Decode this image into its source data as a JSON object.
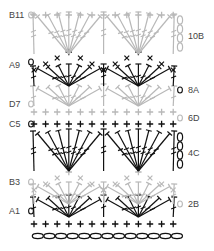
{
  "diagram": {
    "type": "crochet-chart",
    "colors": {
      "dark": "#111111",
      "light": "#b8b8b8"
    },
    "left_labels": [
      {
        "text": "B11",
        "y": 15
      },
      {
        "text": "A9",
        "y": 65
      },
      {
        "text": "D7",
        "y": 104
      },
      {
        "text": "C5",
        "y": 124
      },
      {
        "text": "B3",
        "y": 182
      },
      {
        "text": "A1",
        "y": 211
      }
    ],
    "right_labels": [
      {
        "text": "10B",
        "y": 36
      },
      {
        "text": "8A",
        "y": 90
      },
      {
        "text": "6D",
        "y": 118
      },
      {
        "text": "4C",
        "y": 153
      },
      {
        "text": "2B",
        "y": 204
      }
    ],
    "rows": [
      {
        "id": "foundation-chain",
        "y": 236,
        "symbol": "chain",
        "color": "dark",
        "count": 13
      },
      {
        "id": "row-0-sc",
        "y": 224,
        "symbol": "sc",
        "color": "dark",
        "count": 13
      },
      {
        "id": "row-1",
        "y": 211,
        "symbol": "dc-fan",
        "color": "dark"
      },
      {
        "id": "row-2",
        "y": 198,
        "symbol": "dc-fan",
        "color": "light"
      },
      {
        "id": "row-3",
        "y": 182,
        "symbol": "sc-arch",
        "color": "light"
      },
      {
        "id": "row-4",
        "y": 153,
        "symbol": "tr-fan",
        "color": "dark"
      },
      {
        "id": "row-5",
        "y": 124,
        "symbol": "sc",
        "color": "dark",
        "count": 13
      },
      {
        "id": "row-6",
        "y": 112,
        "symbol": "sc",
        "color": "light",
        "count": 13
      },
      {
        "id": "row-7",
        "y": 100,
        "symbol": "dc-fan",
        "color": "light"
      },
      {
        "id": "row-8",
        "y": 80,
        "symbol": "dc-fan",
        "color": "dark"
      },
      {
        "id": "row-9",
        "y": 62,
        "symbol": "sc-arch",
        "color": "dark"
      },
      {
        "id": "row-10",
        "y": 36,
        "symbol": "tr-fan",
        "color": "light"
      },
      {
        "id": "row-11",
        "y": 15,
        "symbol": "sc",
        "color": "light",
        "count": 13
      }
    ]
  }
}
